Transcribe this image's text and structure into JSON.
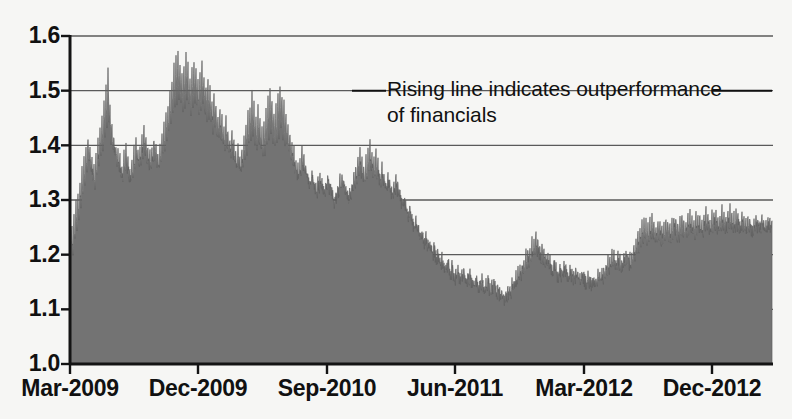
{
  "chart_data": {
    "type": "area",
    "title": "",
    "subtitle": "",
    "xlabel": "",
    "ylabel": "",
    "ylim": [
      1.0,
      1.6
    ],
    "xlim": [
      "Mar-2009",
      "Dec-2012"
    ],
    "grid": true,
    "legend": null,
    "y_ticks": [
      "1.0",
      "1.1",
      "1.2",
      "1.3",
      "1.4",
      "1.5",
      "1.6"
    ],
    "y_tick_values": [
      1.0,
      1.1,
      1.2,
      1.3,
      1.4,
      1.5,
      1.6
    ],
    "x_ticks": [
      "Mar-2009",
      "Dec-2009",
      "Sep-2010",
      "Jun-2011",
      "Mar-2012",
      "Dec-2012"
    ],
    "annotations": [
      {
        "text": "Rising line indicates outperformance\nof financials",
        "leader_lines": true
      }
    ],
    "series": [
      {
        "name": "Relative performance ratio",
        "fill_color": "#737373",
        "line_color": "#5e5e5e",
        "baseline": 1.0,
        "x_start": "Mar-2009",
        "x_end": "Dec-2012",
        "sample_count": 703,
        "values": [
          1.232,
          1.215,
          1.245,
          1.198,
          1.262,
          1.221,
          1.288,
          1.24,
          1.305,
          1.258,
          1.33,
          1.285,
          1.352,
          1.3,
          1.368,
          1.318,
          1.392,
          1.34,
          1.41,
          1.36,
          1.398,
          1.345,
          1.372,
          1.33,
          1.355,
          1.318,
          1.38,
          1.34,
          1.402,
          1.355,
          1.425,
          1.372,
          1.45,
          1.39,
          1.475,
          1.408,
          1.498,
          1.42,
          1.53,
          1.438,
          1.465,
          1.402,
          1.43,
          1.388,
          1.412,
          1.372,
          1.398,
          1.36,
          1.385,
          1.352,
          1.372,
          1.342,
          1.36,
          1.335,
          1.378,
          1.345,
          1.392,
          1.355,
          1.368,
          1.34,
          1.355,
          1.33,
          1.37,
          1.342,
          1.388,
          1.355,
          1.402,
          1.368,
          1.385,
          1.352,
          1.398,
          1.362,
          1.412,
          1.375,
          1.425,
          1.382,
          1.405,
          1.368,
          1.392,
          1.358,
          1.38,
          1.35,
          1.395,
          1.362,
          1.41,
          1.372,
          1.398,
          1.36,
          1.385,
          1.352,
          1.4,
          1.365,
          1.418,
          1.378,
          1.435,
          1.39,
          1.452,
          1.402,
          1.47,
          1.415,
          1.492,
          1.43,
          1.515,
          1.448,
          1.538,
          1.462,
          1.552,
          1.475,
          1.565,
          1.482,
          1.548,
          1.47,
          1.528,
          1.458,
          1.545,
          1.468,
          1.558,
          1.478,
          1.542,
          1.465,
          1.522,
          1.452,
          1.538,
          1.462,
          1.552,
          1.472,
          1.535,
          1.46,
          1.515,
          1.448,
          1.528,
          1.455,
          1.542,
          1.465,
          1.525,
          1.452,
          1.505,
          1.44,
          1.518,
          1.448,
          1.498,
          1.432,
          1.478,
          1.42,
          1.492,
          1.428,
          1.472,
          1.415,
          1.452,
          1.402,
          1.465,
          1.41,
          1.445,
          1.398,
          1.428,
          1.388,
          1.442,
          1.395,
          1.422,
          1.382,
          1.405,
          1.372,
          1.418,
          1.378,
          1.398,
          1.365,
          1.382,
          1.355,
          1.395,
          1.362,
          1.375,
          1.348,
          1.392,
          1.358,
          1.412,
          1.368,
          1.432,
          1.38,
          1.452,
          1.392,
          1.47,
          1.402,
          1.488,
          1.412,
          1.468,
          1.4,
          1.448,
          1.388,
          1.462,
          1.395,
          1.442,
          1.385,
          1.425,
          1.375,
          1.44,
          1.382,
          1.458,
          1.392,
          1.478,
          1.402,
          1.495,
          1.412,
          1.478,
          1.4,
          1.458,
          1.39,
          1.472,
          1.398,
          1.49,
          1.408,
          1.508,
          1.418,
          1.49,
          1.408,
          1.47,
          1.398,
          1.452,
          1.388,
          1.435,
          1.378,
          1.418,
          1.368,
          1.402,
          1.358,
          1.388,
          1.35,
          1.372,
          1.342,
          1.358,
          1.335,
          1.372,
          1.342,
          1.39,
          1.352,
          1.375,
          1.345,
          1.36,
          1.338,
          1.345,
          1.33,
          1.332,
          1.322,
          1.345,
          1.328,
          1.332,
          1.32,
          1.318,
          1.31,
          1.33,
          1.318,
          1.342,
          1.325,
          1.328,
          1.318,
          1.315,
          1.308,
          1.328,
          1.315,
          1.34,
          1.322,
          1.325,
          1.315,
          1.312,
          1.305,
          1.298,
          1.292,
          1.31,
          1.3,
          1.322,
          1.308,
          1.335,
          1.315,
          1.348,
          1.322,
          1.332,
          1.315,
          1.318,
          1.308,
          1.302,
          1.295,
          1.315,
          1.302,
          1.33,
          1.312,
          1.345,
          1.32,
          1.36,
          1.328,
          1.375,
          1.335,
          1.39,
          1.342,
          1.372,
          1.335,
          1.355,
          1.328,
          1.37,
          1.335,
          1.385,
          1.342,
          1.4,
          1.35,
          1.385,
          1.342,
          1.368,
          1.335,
          1.382,
          1.34,
          1.365,
          1.332,
          1.348,
          1.325,
          1.362,
          1.332,
          1.345,
          1.322,
          1.33,
          1.315,
          1.342,
          1.32,
          1.328,
          1.312,
          1.312,
          1.302,
          1.325,
          1.308,
          1.338,
          1.315,
          1.322,
          1.308,
          1.305,
          1.298,
          1.29,
          1.285,
          1.302,
          1.29,
          1.285,
          1.278,
          1.27,
          1.265,
          1.282,
          1.27,
          1.265,
          1.258,
          1.25,
          1.245,
          1.262,
          1.25,
          1.245,
          1.238,
          1.23,
          1.225,
          1.242,
          1.23,
          1.225,
          1.218,
          1.232,
          1.22,
          1.215,
          1.208,
          1.222,
          1.21,
          1.205,
          1.198,
          1.212,
          1.2,
          1.195,
          1.188,
          1.202,
          1.19,
          1.185,
          1.178,
          1.192,
          1.18,
          1.175,
          1.168,
          1.182,
          1.172,
          1.188,
          1.175,
          1.17,
          1.162,
          1.178,
          1.165,
          1.16,
          1.152,
          1.168,
          1.158,
          1.172,
          1.16,
          1.155,
          1.148,
          1.162,
          1.152,
          1.168,
          1.155,
          1.15,
          1.142,
          1.158,
          1.148,
          1.162,
          1.15,
          1.145,
          1.138,
          1.152,
          1.142,
          1.158,
          1.148,
          1.142,
          1.135,
          1.148,
          1.138,
          1.152,
          1.142,
          1.138,
          1.13,
          1.145,
          1.135,
          1.15,
          1.14,
          1.135,
          1.128,
          1.142,
          1.132,
          1.148,
          1.138,
          1.132,
          1.125,
          1.14,
          1.13,
          1.125,
          1.118,
          1.132,
          1.122,
          1.118,
          1.112,
          1.128,
          1.118,
          1.132,
          1.122,
          1.138,
          1.126,
          1.145,
          1.132,
          1.152,
          1.138,
          1.16,
          1.145,
          1.168,
          1.15,
          1.175,
          1.155,
          1.182,
          1.16,
          1.19,
          1.165,
          1.198,
          1.172,
          1.205,
          1.178,
          1.212,
          1.182,
          1.22,
          1.188,
          1.228,
          1.192,
          1.235,
          1.198,
          1.222,
          1.192,
          1.208,
          1.185,
          1.218,
          1.19,
          1.205,
          1.182,
          1.192,
          1.175,
          1.202,
          1.18,
          1.19,
          1.172,
          1.178,
          1.165,
          1.188,
          1.17,
          1.175,
          1.162,
          1.165,
          1.155,
          1.172,
          1.16,
          1.168,
          1.158,
          1.178,
          1.162,
          1.17,
          1.158,
          1.162,
          1.152,
          1.17,
          1.158,
          1.165,
          1.155,
          1.16,
          1.15,
          1.168,
          1.155,
          1.162,
          1.152,
          1.158,
          1.148,
          1.165,
          1.152,
          1.158,
          1.148,
          1.152,
          1.145,
          1.16,
          1.15,
          1.155,
          1.145,
          1.15,
          1.142,
          1.158,
          1.148,
          1.155,
          1.145,
          1.162,
          1.15,
          1.158,
          1.148,
          1.165,
          1.152,
          1.172,
          1.158,
          1.18,
          1.162,
          1.188,
          1.168,
          1.195,
          1.172,
          1.202,
          1.178,
          1.195,
          1.175,
          1.188,
          1.17,
          1.198,
          1.178,
          1.192,
          1.175,
          1.185,
          1.17,
          1.195,
          1.178,
          1.205,
          1.182,
          1.198,
          1.18,
          1.192,
          1.175,
          1.202,
          1.182,
          1.212,
          1.188,
          1.222,
          1.195,
          1.232,
          1.202,
          1.242,
          1.208,
          1.252,
          1.215,
          1.262,
          1.222,
          1.255,
          1.218,
          1.248,
          1.215,
          1.258,
          1.222,
          1.268,
          1.228,
          1.258,
          1.222,
          1.25,
          1.218,
          1.26,
          1.225,
          1.252,
          1.22,
          1.245,
          1.215,
          1.255,
          1.222,
          1.265,
          1.228,
          1.258,
          1.225,
          1.25,
          1.22,
          1.26,
          1.228,
          1.268,
          1.232,
          1.26,
          1.228,
          1.252,
          1.222,
          1.262,
          1.23,
          1.27,
          1.235,
          1.262,
          1.23,
          1.255,
          1.226,
          1.265,
          1.232,
          1.272,
          1.238,
          1.264,
          1.232,
          1.256,
          1.228,
          1.266,
          1.234,
          1.274,
          1.24,
          1.266,
          1.236,
          1.258,
          1.23,
          1.268,
          1.238,
          1.276,
          1.242,
          1.268,
          1.238,
          1.26,
          1.234,
          1.27,
          1.24,
          1.278,
          1.244,
          1.27,
          1.24,
          1.262,
          1.236,
          1.272,
          1.242,
          1.28,
          1.246,
          1.272,
          1.244,
          1.264,
          1.238,
          1.274,
          1.244,
          1.282,
          1.248,
          1.274,
          1.246,
          1.266,
          1.242,
          1.276,
          1.248,
          1.268,
          1.244,
          1.26,
          1.24,
          1.27,
          1.246,
          1.262,
          1.242,
          1.255,
          1.238,
          1.265,
          1.244,
          1.258,
          1.24,
          1.25,
          1.236,
          1.26,
          1.242,
          1.268,
          1.246,
          1.262,
          1.244,
          1.256,
          1.24,
          1.264,
          1.246,
          1.258,
          1.242,
          1.252,
          1.24,
          1.26,
          1.246,
          1.254,
          1.242,
          1.262
        ]
      }
    ]
  },
  "axes": {
    "y_labels": [
      "1.6",
      "1.5",
      "1.4",
      "1.3",
      "1.2",
      "1.1",
      "1.0"
    ],
    "x_labels": [
      "Mar-2009",
      "Dec-2009",
      "Sep-2010",
      "Jun-2011",
      "Mar-2012",
      "Dec-2012"
    ]
  },
  "annotation": {
    "line1": "Rising line indicates outperformance",
    "line2": "of financials",
    "full_text": "Rising line indicates outperformance\nof financials"
  },
  "colors": {
    "fill": "#737373",
    "axis": "#141414",
    "grid": "#5a5a5a",
    "background": "#f6f6f4",
    "text": "#111111"
  }
}
